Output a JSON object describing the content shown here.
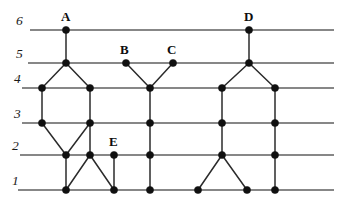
{
  "figure": {
    "width": 338,
    "height": 206,
    "background_color": "#ffffff",
    "line_color": "#5f5f5f",
    "edge_color": "#2b2b2b",
    "node_color": "#101010"
  },
  "chart_data": {
    "type": "diagram",
    "title": "",
    "xlabel": "",
    "ylabel": "",
    "levels": [
      {
        "label": "6",
        "y": 30,
        "x_start": 30,
        "x_end": 334
      },
      {
        "label": "5",
        "y": 63,
        "x_start": 28,
        "x_end": 334
      },
      {
        "label": "4",
        "y": 88,
        "x_start": 22,
        "x_end": 334
      },
      {
        "label": "3",
        "y": 123,
        "x_start": 22,
        "x_end": 334
      },
      {
        "label": "2",
        "y": 155,
        "x_start": 20,
        "x_end": 334
      },
      {
        "label": "1",
        "y": 190,
        "x_start": 18,
        "x_end": 334
      }
    ],
    "level_label_positions": [
      {
        "label": "6",
        "x": 16,
        "y": 14
      },
      {
        "label": "5",
        "x": 16,
        "y": 47
      },
      {
        "label": "4",
        "x": 14,
        "y": 72
      },
      {
        "label": "3",
        "x": 14,
        "y": 107
      },
      {
        "label": "2",
        "x": 12,
        "y": 139
      },
      {
        "label": "1",
        "x": 12,
        "y": 174
      }
    ],
    "nodes": [
      {
        "id": "a6",
        "x": 66,
        "y": 30,
        "level": 6,
        "label": "A"
      },
      {
        "id": "d6",
        "x": 249,
        "y": 30,
        "level": 6,
        "label": "D"
      },
      {
        "id": "n5a",
        "x": 66,
        "y": 63,
        "level": 5,
        "label": ""
      },
      {
        "id": "b5",
        "x": 126,
        "y": 63,
        "level": 5,
        "label": "B"
      },
      {
        "id": "c5",
        "x": 173,
        "y": 63,
        "level": 5,
        "label": "C"
      },
      {
        "id": "n5d",
        "x": 249,
        "y": 63,
        "level": 5,
        "label": ""
      },
      {
        "id": "n4a",
        "x": 42,
        "y": 88,
        "level": 4,
        "label": ""
      },
      {
        "id": "n4b",
        "x": 90,
        "y": 88,
        "level": 4,
        "label": ""
      },
      {
        "id": "n4c",
        "x": 150,
        "y": 88,
        "level": 4,
        "label": ""
      },
      {
        "id": "n4d",
        "x": 222,
        "y": 88,
        "level": 4,
        "label": ""
      },
      {
        "id": "n4e",
        "x": 275,
        "y": 88,
        "level": 4,
        "label": ""
      },
      {
        "id": "n3a",
        "x": 42,
        "y": 123,
        "level": 3,
        "label": ""
      },
      {
        "id": "n3b",
        "x": 90,
        "y": 123,
        "level": 3,
        "label": ""
      },
      {
        "id": "n3c",
        "x": 150,
        "y": 123,
        "level": 3,
        "label": ""
      },
      {
        "id": "n3d",
        "x": 222,
        "y": 123,
        "level": 3,
        "label": ""
      },
      {
        "id": "n3e",
        "x": 275,
        "y": 123,
        "level": 3,
        "label": ""
      },
      {
        "id": "n2a",
        "x": 66,
        "y": 155,
        "level": 2,
        "label": ""
      },
      {
        "id": "n2b",
        "x": 90,
        "y": 155,
        "level": 2,
        "label": ""
      },
      {
        "id": "e2",
        "x": 114,
        "y": 155,
        "level": 2,
        "label": "E"
      },
      {
        "id": "n2c",
        "x": 150,
        "y": 155,
        "level": 2,
        "label": ""
      },
      {
        "id": "n2d",
        "x": 222,
        "y": 155,
        "level": 2,
        "label": ""
      },
      {
        "id": "n2e",
        "x": 275,
        "y": 155,
        "level": 2,
        "label": ""
      },
      {
        "id": "n1a",
        "x": 66,
        "y": 190,
        "level": 1,
        "label": ""
      },
      {
        "id": "n1b",
        "x": 114,
        "y": 190,
        "level": 1,
        "label": ""
      },
      {
        "id": "n1c",
        "x": 150,
        "y": 190,
        "level": 1,
        "label": ""
      },
      {
        "id": "n1d",
        "x": 198,
        "y": 190,
        "level": 1,
        "label": ""
      },
      {
        "id": "n1e",
        "x": 247,
        "y": 190,
        "level": 1,
        "label": ""
      },
      {
        "id": "n1f",
        "x": 275,
        "y": 190,
        "level": 1,
        "label": ""
      }
    ],
    "edges": [
      {
        "from": "a6",
        "to": "n5a"
      },
      {
        "from": "d6",
        "to": "n5d"
      },
      {
        "from": "n5a",
        "to": "n4a"
      },
      {
        "from": "n5a",
        "to": "n4b"
      },
      {
        "from": "b5",
        "to": "n4c"
      },
      {
        "from": "c5",
        "to": "n4c"
      },
      {
        "from": "n5d",
        "to": "n4d"
      },
      {
        "from": "n5d",
        "to": "n4e"
      },
      {
        "from": "n4a",
        "to": "n3a"
      },
      {
        "from": "n4b",
        "to": "n3b"
      },
      {
        "from": "n4c",
        "to": "n3c"
      },
      {
        "from": "n4d",
        "to": "n3d"
      },
      {
        "from": "n4e",
        "to": "n3e"
      },
      {
        "from": "n3a",
        "to": "n2a"
      },
      {
        "from": "n3b",
        "to": "n2a"
      },
      {
        "from": "n3b",
        "to": "n2b"
      },
      {
        "from": "n3c",
        "to": "n2c"
      },
      {
        "from": "n3d",
        "to": "n2d"
      },
      {
        "from": "n3e",
        "to": "n2e"
      },
      {
        "from": "n2a",
        "to": "n1a"
      },
      {
        "from": "n2b",
        "to": "n1a"
      },
      {
        "from": "n2b",
        "to": "n1b"
      },
      {
        "from": "e2",
        "to": "n1b"
      },
      {
        "from": "n2c",
        "to": "n1c"
      },
      {
        "from": "n2d",
        "to": "n1d"
      },
      {
        "from": "n2d",
        "to": "n1e"
      },
      {
        "from": "n2e",
        "to": "n1f"
      }
    ],
    "node_label_positions": [
      {
        "label": "A",
        "x": 61,
        "y": 10
      },
      {
        "label": "D",
        "x": 244,
        "y": 10
      },
      {
        "label": "B",
        "x": 120,
        "y": 43
      },
      {
        "label": "C",
        "x": 167,
        "y": 43
      },
      {
        "label": "E",
        "x": 109,
        "y": 135
      }
    ],
    "node_radius": 3.6
  }
}
